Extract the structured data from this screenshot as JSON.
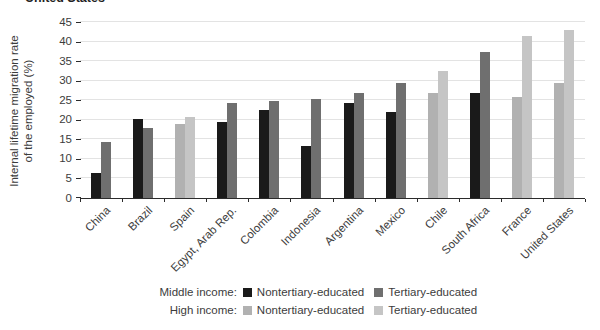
{
  "page": {
    "clipped_title": "United States"
  },
  "chart_data": {
    "type": "bar",
    "title": "",
    "ylabel_line1": "Internal lifetime migration rate",
    "ylabel_line2": "of the employed (%)",
    "ylim": [
      0,
      45
    ],
    "yticks": [
      0,
      5,
      10,
      15,
      20,
      25,
      30,
      35,
      40,
      45
    ],
    "grid": "horizontal",
    "legend_position": "bottom",
    "categories": [
      "China",
      "Brazil",
      "Spain",
      "Egypt, Arab Rep.",
      "Colombia",
      "Indonesia",
      "Argentina",
      "Mexico",
      "Chile",
      "South Africa",
      "France",
      "United States"
    ],
    "income_group": [
      "middle",
      "middle",
      "high",
      "middle",
      "middle",
      "middle",
      "middle",
      "middle",
      "high",
      "middle",
      "high",
      "high"
    ],
    "series": [
      {
        "name": "Nontertiary-educated",
        "values": [
          6.5,
          20.2,
          18.9,
          19.4,
          22.4,
          13.4,
          24.4,
          22.0,
          26.9,
          26.8,
          25.9,
          29.4
        ]
      },
      {
        "name": "Tertiary-educated",
        "values": [
          14.2,
          17.9,
          20.6,
          24.2,
          24.9,
          25.4,
          26.8,
          29.5,
          32.4,
          37.4,
          41.5,
          42.9
        ]
      }
    ],
    "colors": {
      "middle_nontertiary": "#1a1a1a",
      "middle_tertiary": "#6f6f6f",
      "high_nontertiary": "#b1b1b1",
      "high_tertiary": "#c5c5c5"
    },
    "legend": {
      "rows": [
        {
          "label": "Middle income:",
          "items": [
            {
              "name": "Nontertiary-educated",
              "color_key": "middle_nontertiary"
            },
            {
              "name": "Tertiary-educated",
              "color_key": "middle_tertiary"
            }
          ]
        },
        {
          "label": "High income:",
          "items": [
            {
              "name": "Nontertiary-educated",
              "color_key": "high_nontertiary"
            },
            {
              "name": "Tertiary-educated",
              "color_key": "high_tertiary"
            }
          ]
        }
      ]
    }
  }
}
